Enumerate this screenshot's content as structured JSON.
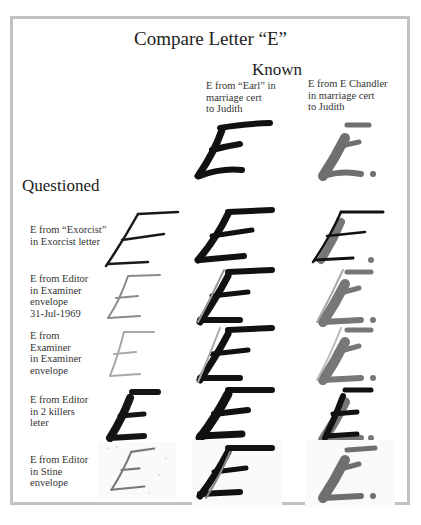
{
  "title": "Compare Letter “E”",
  "known_header": "Known",
  "questioned_header": "Questioned",
  "known_columns": [
    {
      "label_lines": [
        "E from “Earl” in",
        "marriage cert",
        "to Judith"
      ],
      "ink": "#111111"
    },
    {
      "label_lines": [
        "E from E Chandler",
        "in marriage cert",
        "to Judith"
      ],
      "ink": "#6f6f6f"
    }
  ],
  "questioned_rows": [
    {
      "label_lines": [
        "E from “Exorcist”",
        "in Exorcist letter"
      ],
      "ink": "#1a1a1a",
      "style": "thin-dark"
    },
    {
      "label_lines": [
        "E from Editor",
        "in Examiner",
        "envelope",
        "31-Jul-1969"
      ],
      "ink": "#8a8a8a",
      "style": "thin-gray"
    },
    {
      "label_lines": [
        "E from",
        "Examiner",
        "in Examiner",
        "envelope"
      ],
      "ink": "#a0a0a0",
      "style": "thin-light"
    },
    {
      "label_lines": [
        "E from Editor",
        "in 2 killers",
        "leter"
      ],
      "ink": "#151515",
      "style": "bold-dark"
    },
    {
      "label_lines": [
        "E from Editor",
        "in Stine",
        "envelope"
      ],
      "ink": "#777777",
      "style": "thin-speckled"
    }
  ],
  "colors": {
    "frame": "#c2c2c2",
    "known_dark": "#111111",
    "known_gray": "#6f6f6f"
  }
}
